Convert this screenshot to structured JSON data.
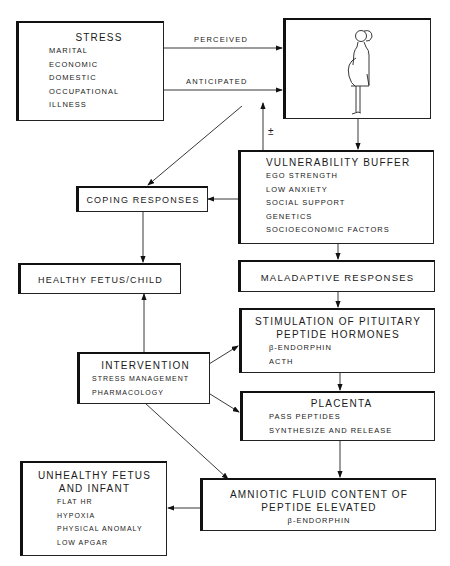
{
  "stress": {
    "title": "STRESS",
    "items": [
      "MARITAL",
      "ECONOMIC",
      "DOMESTIC",
      "OCCUPATIONAL",
      "ILLNESS"
    ]
  },
  "edges": {
    "perceived": "PERCEIVED",
    "anticipated": "ANTICIPATED",
    "plus_minus": "±"
  },
  "mother": {
    "figure": "pregnant-woman-illustration"
  },
  "vulnerability": {
    "title": "VULNERABILITY BUFFER",
    "items": [
      "EGO STRENGTH",
      "LOW ANXIETY",
      "SOCIAL SUPPORT",
      "GENETICS",
      "SOCIOECONOMIC FACTORS"
    ]
  },
  "coping": {
    "title": "COPING RESPONSES"
  },
  "healthy": {
    "title": "HEALTHY FETUS/CHILD"
  },
  "maladaptive": {
    "title": "MALADAPTIVE RESPONSES"
  },
  "stimulation": {
    "title1": "STIMULATION OF PITUITARY",
    "title2": "PEPTIDE HORMONES",
    "items": [
      "β-ENDORPHIN",
      "ACTH"
    ]
  },
  "intervention": {
    "title": "INTERVENTION",
    "items": [
      "STRESS MANAGEMENT",
      "PHARMACOLOGY"
    ]
  },
  "placenta": {
    "title": "PLACENTA",
    "items": [
      "PASS PEPTIDES",
      "SYNTHESIZE AND RELEASE"
    ]
  },
  "unhealthy": {
    "title1": "UNHEALTHY FETUS",
    "title2": "AND INFANT",
    "items": [
      "FLAT HR",
      "HYPOXIA",
      "PHYSICAL ANOMALY",
      "LOW APGAR"
    ]
  },
  "amniotic": {
    "title1": "AMNIOTIC FLUID CONTENT OF",
    "title2": "PEPTIDE ELEVATED",
    "items": [
      "β-ENDORPHIN"
    ]
  }
}
